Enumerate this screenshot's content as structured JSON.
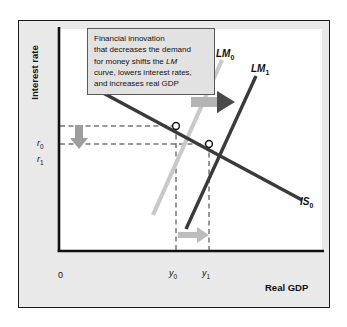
{
  "figure": {
    "type": "diagram",
    "axes": {
      "y_title": "Interest rate",
      "x_title": "Real GDP",
      "origin_label": "0"
    },
    "callout": {
      "line1": "Financial innovation",
      "line2": "that decreases the demand",
      "line3_pre": "for money shifts the ",
      "line3_em": "LM",
      "line4": "curve, lowers interest rates,",
      "line5": "and increases real GDP"
    },
    "curves": [
      {
        "id": "lm0",
        "label_base": "LM",
        "label_sub": "0",
        "color": "#c9c9c9",
        "role": "initial-lm-curve"
      },
      {
        "id": "lm1",
        "label_base": "LM",
        "label_sub": "1",
        "color": "#3a3a3a",
        "role": "shifted-lm-curve"
      },
      {
        "id": "is0",
        "label_base": "IS",
        "label_sub": "0",
        "color": "#3a3a3a",
        "role": "is-curve"
      }
    ],
    "ticks": {
      "r0_base": "r",
      "r0_sub": "0",
      "r1_base": "r",
      "r1_sub": "1",
      "y0_base": "y",
      "y0_sub": "0",
      "y1_base": "y",
      "y1_sub": "1"
    },
    "equilibria": [
      {
        "id": "eq0",
        "interest_rate": "r0",
        "real_gdp": "y0"
      },
      {
        "id": "eq1",
        "interest_rate": "r1",
        "real_gdp": "y1"
      }
    ],
    "arrows": [
      {
        "id": "shift-arrow",
        "direction": "right",
        "meaning": "LM curve shifts right"
      },
      {
        "id": "rate-arrow",
        "direction": "down",
        "meaning": "interest rate falls from r0 to r1"
      },
      {
        "id": "gdp-arrow",
        "direction": "right",
        "meaning": "real GDP rises from y0 to y1"
      }
    ],
    "colors": {
      "panel_background": "#e9e9e9",
      "plot_background": "#ffffff",
      "axis": "#111111",
      "dark_curve": "#3a3a3a",
      "light_curve": "#c9c9c9",
      "arrow_gray": "#a8a8a8",
      "arrow_dark": "#4a4a4a",
      "dashed_guide": "#333333"
    }
  }
}
